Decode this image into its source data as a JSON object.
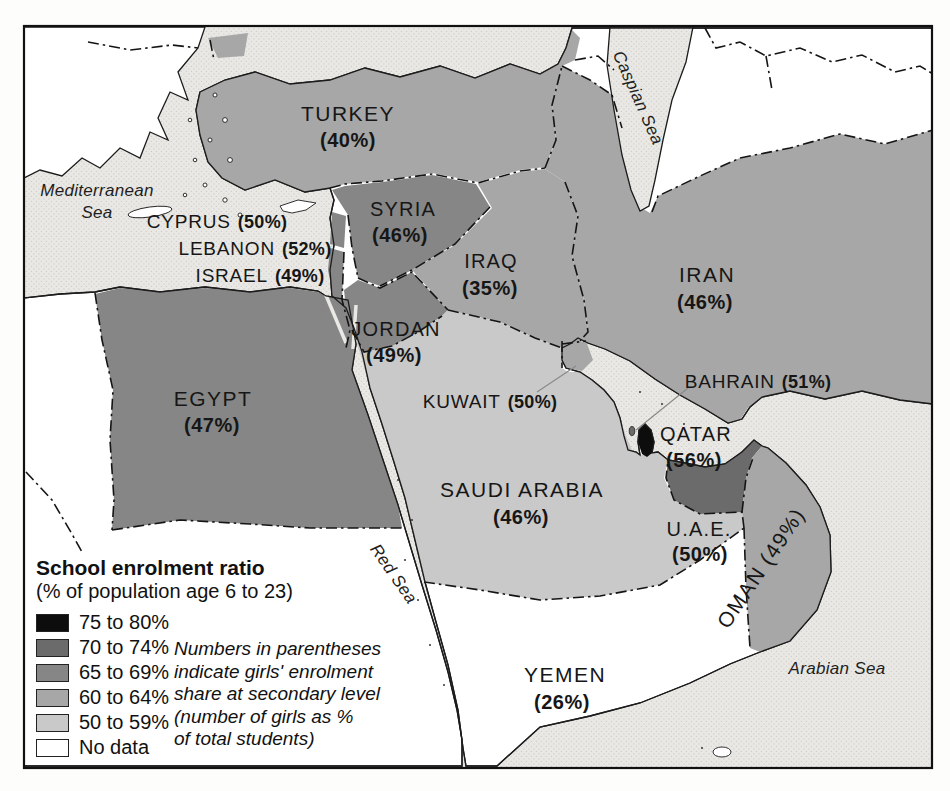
{
  "palette": {
    "sea": "#e9e8e5",
    "sea_dot": "#cfcec9",
    "land_no_data": "#ffffff",
    "c50": "#c9c9c9",
    "c60": "#a7a7a7",
    "c65": "#868686",
    "c70": "#6b6b6b",
    "c75": "#0d0d0d",
    "border": "#1a1a1a"
  },
  "legend": {
    "title": "School enrolment ratio",
    "subtitle": "(% of population age 6 to 23)",
    "classes": [
      {
        "label": "75 to 80%",
        "color": "#0d0d0d"
      },
      {
        "label": "70 to 74%",
        "color": "#6b6b6b"
      },
      {
        "label": "65 to 69%",
        "color": "#868686"
      },
      {
        "label": "60 to 64%",
        "color": "#a7a7a7"
      },
      {
        "label": "50 to 59%",
        "color": "#c9c9c9"
      },
      {
        "label": "No data",
        "color": "#ffffff"
      }
    ],
    "note_lines": [
      "Numbers in parentheses",
      "indicate girls' enrolment",
      "share at secondary level",
      "(number of girls as %",
      "of total students)"
    ]
  },
  "map": {
    "countries": [
      {
        "name": "TURKEY",
        "girls_share": "(40%)",
        "enrolment_class": "60 to 64%"
      },
      {
        "name": "CYPRUS",
        "girls_share": "(50%)",
        "enrolment_class": "No data"
      },
      {
        "name": "LEBANON",
        "girls_share": "(52%)",
        "enrolment_class": "65 to 69%"
      },
      {
        "name": "ISRAEL",
        "girls_share": "(49%)",
        "enrolment_class": "65 to 69%"
      },
      {
        "name": "SYRIA",
        "girls_share": "(46%)",
        "enrolment_class": "65 to 69%"
      },
      {
        "name": "IRAQ",
        "girls_share": "(35%)",
        "enrolment_class": "60 to 64%"
      },
      {
        "name": "IRAN",
        "girls_share": "(46%)",
        "enrolment_class": "60 to 64%"
      },
      {
        "name": "JORDAN",
        "girls_share": "(49%)",
        "enrolment_class": "65 to 69%"
      },
      {
        "name": "EGYPT",
        "girls_share": "(47%)",
        "enrolment_class": "65 to 69%"
      },
      {
        "name": "KUWAIT",
        "girls_share": "(50%)",
        "enrolment_class": "60 to 64%"
      },
      {
        "name": "BAHRAIN",
        "girls_share": "(51%)",
        "enrolment_class": "70 to 74%"
      },
      {
        "name": "QATAR",
        "girls_share": "(56%)",
        "enrolment_class": "75 to 80%"
      },
      {
        "name": "SAUDI ARABIA",
        "girls_share": "(46%)",
        "enrolment_class": "50 to 59%"
      },
      {
        "name": "U.A.E.",
        "girls_share": "(50%)",
        "enrolment_class": "70 to 74%"
      },
      {
        "name": "OMAN",
        "girls_share": "(49%)",
        "enrolment_class": "60 to 64%"
      },
      {
        "name": "YEMEN",
        "girls_share": "(26%)",
        "enrolment_class": "No data"
      }
    ],
    "oman_label": "OMAN (49%)",
    "seas": {
      "mediterranean_line1": "Mediterranean",
      "mediterranean_line2": "Sea",
      "red": "Red Sea",
      "caspian": "Caspian Sea",
      "arabian": "Arabian Sea"
    }
  }
}
